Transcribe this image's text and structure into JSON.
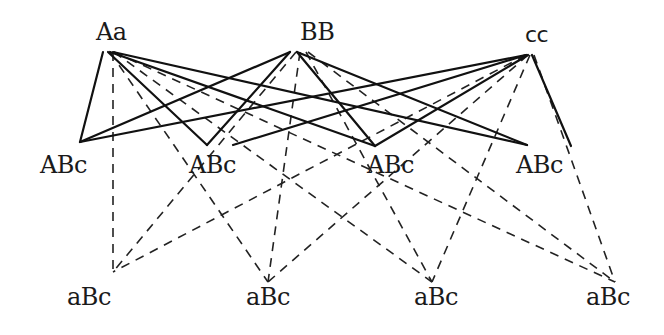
{
  "diagram": {
    "parents": [
      {
        "id": "Aa",
        "label": "Aa",
        "x": 96,
        "y": 20
      },
      {
        "id": "BB",
        "label": "BB",
        "x": 300,
        "y": 20
      },
      {
        "id": "cc",
        "label": "cc",
        "x": 525,
        "y": 24
      }
    ],
    "middle": [
      {
        "id": "m1",
        "label": "ABc",
        "x": 40,
        "y": 153
      },
      {
        "id": "m2",
        "label": "ABc",
        "x": 189,
        "y": 153
      },
      {
        "id": "m3",
        "label": "ABc",
        "x": 367,
        "y": 153
      },
      {
        "id": "m4",
        "label": "ABc",
        "x": 516,
        "y": 153
      }
    ],
    "bottom": [
      {
        "id": "b1",
        "label": "aBc",
        "x": 67,
        "y": 285
      },
      {
        "id": "b2",
        "label": "aBc",
        "x": 246,
        "y": 285
      },
      {
        "id": "b3",
        "label": "aBc",
        "x": 414,
        "y": 285
      },
      {
        "id": "b4",
        "label": "aBc",
        "x": 586,
        "y": 285
      }
    ],
    "solid_edges": [
      [
        103,
        52,
        80,
        142
      ],
      [
        108,
        52,
        207,
        145
      ],
      [
        110,
        52,
        375,
        146
      ],
      [
        113,
        52,
        527,
        145
      ],
      [
        290,
        52,
        80,
        142
      ],
      [
        290,
        52,
        207,
        145
      ],
      [
        297,
        52,
        375,
        146
      ],
      [
        297,
        52,
        527,
        145
      ],
      [
        526,
        55,
        80,
        142
      ],
      [
        526,
        55,
        233,
        145
      ],
      [
        528,
        55,
        375,
        146
      ],
      [
        532,
        55,
        571,
        146
      ]
    ],
    "dashed_edges": [
      [
        113,
        52,
        113,
        272
      ],
      [
        110,
        52,
        268,
        282
      ],
      [
        114,
        52,
        432,
        282
      ],
      [
        114,
        52,
        615,
        282
      ],
      [
        296,
        52,
        113,
        272
      ],
      [
        300,
        52,
        268,
        282
      ],
      [
        306,
        52,
        432,
        282
      ],
      [
        308,
        52,
        615,
        282
      ],
      [
        526,
        55,
        113,
        272
      ],
      [
        528,
        55,
        268,
        282
      ],
      [
        530,
        55,
        432,
        282
      ],
      [
        534,
        55,
        615,
        282
      ]
    ]
  }
}
